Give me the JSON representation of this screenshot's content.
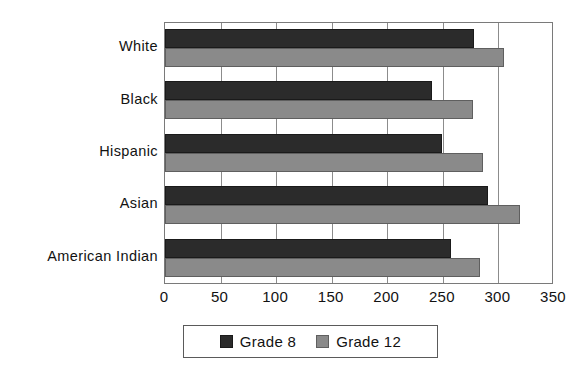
{
  "chart_data": {
    "type": "bar",
    "orientation": "horizontal",
    "title": "",
    "subtitle": "",
    "xlabel": "",
    "ylabel": "",
    "categories": [
      "White",
      "Black",
      "Hispanic",
      "Asian",
      "American Indian"
    ],
    "series": [
      {
        "name": "Grade 8",
        "color": "#2b2b2b",
        "values": [
          278,
          240,
          249,
          291,
          257
        ]
      },
      {
        "name": "Grade 12",
        "color": "#8a8a8a",
        "values": [
          305,
          277,
          286,
          319,
          283
        ]
      }
    ],
    "xlim": [
      0,
      350
    ],
    "xticks": [
      0,
      50,
      100,
      150,
      200,
      250,
      300,
      350
    ],
    "xtick_labels": [
      "0",
      "50",
      "100",
      "150",
      "200",
      "250",
      "300",
      "350"
    ],
    "grid": "vertical",
    "legend_position": "bottom",
    "legend_entries": [
      "Grade 8",
      "Grade 12"
    ]
  },
  "legend": {
    "entries": [
      {
        "label": "Grade 8",
        "swatch": "legend-swatch-grade-8"
      },
      {
        "label": "Grade 12",
        "swatch": "legend-swatch-grade-12"
      }
    ]
  },
  "colors": {
    "grade_8": "#2b2b2b",
    "grade_12": "#8a8a8a",
    "axis": "#7a7a7a",
    "grid": "#8c8c8c",
    "background": "#ffffff"
  }
}
